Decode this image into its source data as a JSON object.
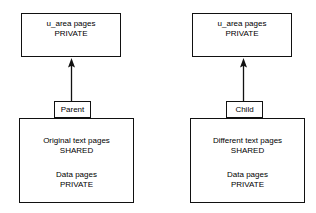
{
  "diagram": {
    "background_color": "#ffffff",
    "stroke_color": "#111111",
    "text_color": "#000000",
    "columns": [
      {
        "id": "parent",
        "top_box": {
          "line1": "u_area pages",
          "line2": "PRIVATE"
        },
        "connector_label": "Parent",
        "bottom_box": {
          "line1": "Original text pages",
          "line2": "SHARED",
          "line3": "Data pages",
          "line4": "PRIVATE"
        },
        "arrow_direction": "up"
      },
      {
        "id": "child",
        "top_box": {
          "line1": "u_area pages",
          "line2": "PRIVATE"
        },
        "connector_label": "Child",
        "bottom_box": {
          "line1": "Different text pages",
          "line2": "SHARED",
          "line3": "Data pages",
          "line4": "PRIVATE"
        },
        "arrow_direction": "up"
      }
    ]
  }
}
